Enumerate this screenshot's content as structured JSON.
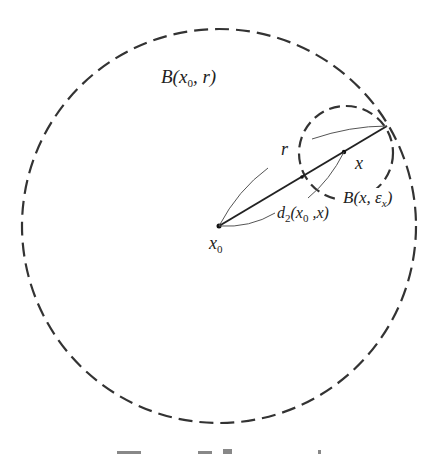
{
  "diagram": {
    "big_ball": {
      "label_main": "B(",
      "label_var": "x",
      "label_sub": "0",
      "label_rest": ", r)",
      "center": [
        219,
        226
      ],
      "radius": 197
    },
    "small_ball": {
      "label_main": "B(x, ",
      "label_eps": "ε",
      "label_sub": "x",
      "label_close": ")",
      "center": [
        346,
        153
      ],
      "radius": 47
    },
    "center_point": {
      "label_var": "x",
      "label_sub": "0"
    },
    "point_x": {
      "label": "x"
    },
    "radius_label": "r",
    "distance_label": {
      "prefix": "d",
      "sub": "2",
      "open": "(x",
      "sub2": "0",
      "rest": " ,x)"
    },
    "colors": {
      "stroke": "#333333",
      "thin": "#555555",
      "text": "#222222"
    }
  }
}
